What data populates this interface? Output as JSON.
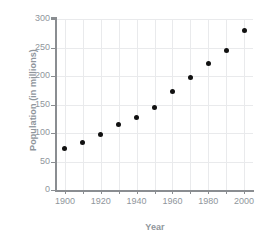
{
  "chart_data": {
    "type": "scatter",
    "title": "",
    "xlabel": "Year",
    "ylabel": "Population (in millions)",
    "xlim": [
      1895,
      2005
    ],
    "ylim": [
      0,
      300
    ],
    "grid": true,
    "legend": "none",
    "marker": {
      "shape": "circle",
      "color": "#111111",
      "size": 5
    },
    "xticks": [
      1900,
      1920,
      1940,
      1960,
      1980,
      2000
    ],
    "xticks_minor": [
      1910,
      1930,
      1950,
      1970,
      1990
    ],
    "yticks": [
      0,
      50,
      100,
      150,
      200,
      250,
      300
    ],
    "x": [
      1900,
      1910,
      1920,
      1930,
      1940,
      1950,
      1960,
      1970,
      1980,
      1990,
      2000
    ],
    "values": [
      72,
      84,
      97,
      115,
      127,
      145,
      172,
      198,
      222,
      245,
      280
    ],
    "points": [
      {
        "x": 1900,
        "y": 72
      },
      {
        "x": 1910,
        "y": 84
      },
      {
        "x": 1920,
        "y": 97
      },
      {
        "x": 1930,
        "y": 115
      },
      {
        "x": 1940,
        "y": 127
      },
      {
        "x": 1950,
        "y": 145
      },
      {
        "x": 1960,
        "y": 172
      },
      {
        "x": 1970,
        "y": 198
      },
      {
        "x": 1980,
        "y": 222
      },
      {
        "x": 1990,
        "y": 245
      },
      {
        "x": 2000,
        "y": 280
      }
    ]
  },
  "style": {
    "axis_label_color": "#8f969c",
    "tick_label_color": "#8f969c",
    "gridline_color": "#e9eaec",
    "spine_color": "#8a8d91",
    "background": "#ffffff"
  }
}
